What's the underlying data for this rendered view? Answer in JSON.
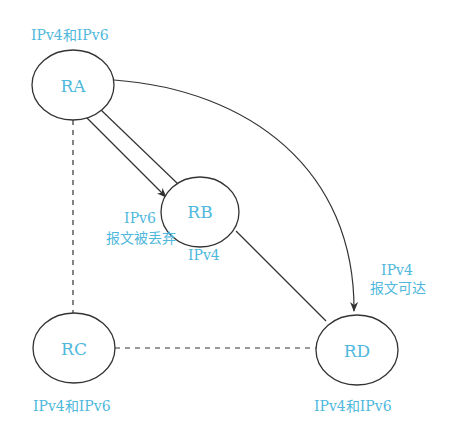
{
  "nodes": [
    {
      "id": "RA",
      "label": "RA",
      "protocol": "IPv4和IPv6"
    },
    {
      "id": "RB",
      "label": "RB",
      "protocol": "IPv4"
    },
    {
      "id": "RC",
      "label": "RC",
      "protocol": "IPv4和IPv6"
    },
    {
      "id": "RD",
      "label": "RD",
      "protocol": "IPv4和IPv6"
    }
  ],
  "annotations": {
    "ipv6_line1": "IPv6",
    "ipv6_line2": "报文被丢弃",
    "ipv4_line1": "IPv4",
    "ipv4_line2": "报文可达"
  },
  "edges": [
    {
      "from": "RA",
      "to": "RB",
      "style": "solid"
    },
    {
      "from": "RA",
      "to": "RB",
      "style": "arrow"
    },
    {
      "from": "RA",
      "to": "RD",
      "style": "curved-arrow"
    },
    {
      "from": "RB",
      "to": "RD",
      "style": "solid"
    },
    {
      "from": "RA",
      "to": "RC",
      "style": "dashed"
    },
    {
      "from": "RC",
      "to": "RD",
      "style": "dashed"
    }
  ],
  "colors": {
    "label": "#4fb8dc",
    "line": "#333333"
  }
}
